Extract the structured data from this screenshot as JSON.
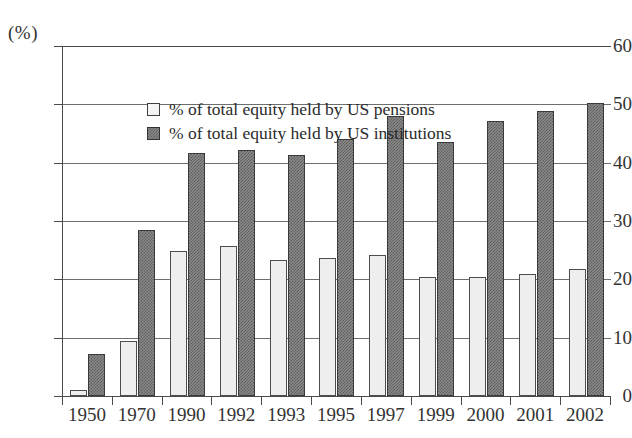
{
  "chart_data": {
    "type": "bar",
    "title": "",
    "subtitle": "",
    "xlabel": "",
    "ylabel": "(%)",
    "unit_label": "(%)",
    "ylim": [
      0,
      60
    ],
    "ytick_step": 10,
    "yticks": [
      "0",
      "10",
      "20",
      "30",
      "40",
      "50",
      "60"
    ],
    "grid": true,
    "legend_position": "top-left inside plot",
    "categories": [
      "1950",
      "1970",
      "1990",
      "1992",
      "1993",
      "1995",
      "1997",
      "1999",
      "2000",
      "2001",
      "2002"
    ],
    "series": [
      {
        "name": "% of total equity held by US pensions",
        "style": "light",
        "color": "#eeeeee",
        "values": [
          1.0,
          9.4,
          24.8,
          25.7,
          23.3,
          23.7,
          24.2,
          20.4,
          20.4,
          21.0,
          21.8
        ]
      },
      {
        "name": "% of total equity held by US institutions",
        "style": "dark-hatched",
        "color": "#8a8a8a",
        "values": [
          7.2,
          28.5,
          41.6,
          42.2,
          41.4,
          44.0,
          48.0,
          43.6,
          47.2,
          48.8,
          50.2
        ]
      }
    ]
  },
  "legend": {
    "items": [
      {
        "label": "% of total equity held by US pensions",
        "swatch": "light"
      },
      {
        "label": "% of total equity held by US institutions",
        "swatch": "dark"
      }
    ]
  }
}
